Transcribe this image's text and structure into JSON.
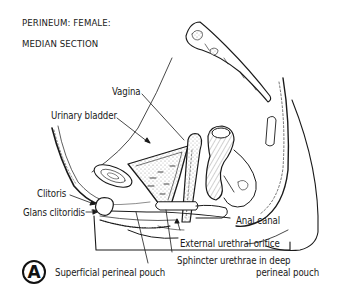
{
  "title": {
    "line1": "PERINEUM: FEMALE:",
    "line2": "MEDIAN SECTION"
  },
  "figure_letter": "A",
  "labels": {
    "vagina": "Vagina",
    "urinary_bladder": "Urinary bladder",
    "clitoris": "Clitoris",
    "glans_clitoridis": "Glans clitoridis",
    "anal_canal": "Anal canal",
    "external_urethral_orifice": "External urethral orifice",
    "sphincter_urethrae_line1": "Sphincter urethrae in deep",
    "sphincter_urethrae_line2": "perineal pouch",
    "superficial_perineal_pouch": "Superficial perineal pouch"
  },
  "colors": {
    "ink": "#1a1a1a",
    "background": "#ffffff",
    "stipple": "#bdbdbd"
  }
}
